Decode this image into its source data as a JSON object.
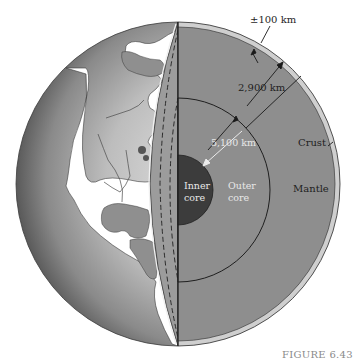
{
  "figure": {
    "caption": "FIGURE 6.43"
  },
  "labels": {
    "crust_thickness": "±100 km",
    "mantle_thickness": "2,900 km",
    "core_radius": "5,100 km",
    "crust": "Crust",
    "mantle": "Mantle",
    "outer_core_line1": "Outer",
    "outer_core_line2": "core",
    "inner_core_line1": "Inner",
    "inner_core_line2": "core"
  },
  "layers": [
    {
      "name": "Crust",
      "color": "#c8c8c8"
    },
    {
      "name": "Mantle",
      "color": "#8c8c8c"
    },
    {
      "name": "Outer core",
      "color": "#8e8e8e"
    },
    {
      "name": "Inner core",
      "color": "#3e3e3e"
    }
  ],
  "colors": {
    "ocean_globe": "#9a9a9a",
    "land": "#ffffff",
    "outline": "#2a2a2a"
  }
}
